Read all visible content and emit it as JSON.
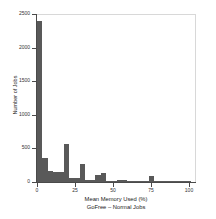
{
  "chart_data": {
    "type": "bar",
    "title": "",
    "xlabel": "Mean Memory Used (%)",
    "sublabel": "GoFree – Normal Jobs",
    "ylabel": "Number of Jobs",
    "xlim": [
      0,
      104
    ],
    "ylim": [
      0,
      2500
    ],
    "grid": false,
    "legend": null,
    "bar_color": "#595959",
    "bin_width": 3.5,
    "xticks": [
      0,
      25,
      50,
      75,
      100
    ],
    "xtick_labels": [
      "0",
      "25",
      "50",
      "75",
      "100"
    ],
    "yticks": [
      0,
      500,
      1000,
      1500,
      2000,
      2500
    ],
    "ytick_labels": [
      "0",
      "500",
      "1000",
      "1500",
      "2000",
      "2500"
    ],
    "bins": [
      {
        "x0": 0.0,
        "x1": 3.5,
        "value": 2400
      },
      {
        "x0": 3.5,
        "x1": 7.0,
        "value": 355
      },
      {
        "x0": 7.0,
        "x1": 10.5,
        "value": 160
      },
      {
        "x0": 10.5,
        "x1": 14.0,
        "value": 150
      },
      {
        "x0": 14.0,
        "x1": 17.5,
        "value": 155
      },
      {
        "x0": 17.5,
        "x1": 21.0,
        "value": 570
      },
      {
        "x0": 21.0,
        "x1": 24.5,
        "value": 60
      },
      {
        "x0": 24.5,
        "x1": 28.0,
        "value": 55
      },
      {
        "x0": 28.0,
        "x1": 31.5,
        "value": 265
      },
      {
        "x0": 31.5,
        "x1": 35.0,
        "value": 30
      },
      {
        "x0": 35.0,
        "x1": 38.5,
        "value": 25
      },
      {
        "x0": 38.5,
        "x1": 42.0,
        "value": 110
      },
      {
        "x0": 42.0,
        "x1": 45.5,
        "value": 130
      },
      {
        "x0": 45.5,
        "x1": 49.0,
        "value": 20
      },
      {
        "x0": 49.0,
        "x1": 52.5,
        "value": 15
      },
      {
        "x0": 52.5,
        "x1": 56.0,
        "value": 35
      },
      {
        "x0": 56.0,
        "x1": 59.5,
        "value": 30
      },
      {
        "x0": 59.5,
        "x1": 63.0,
        "value": 18
      },
      {
        "x0": 63.0,
        "x1": 66.5,
        "value": 12
      },
      {
        "x0": 66.5,
        "x1": 70.0,
        "value": 10
      },
      {
        "x0": 70.0,
        "x1": 73.5,
        "value": 10
      },
      {
        "x0": 73.5,
        "x1": 77.0,
        "value": 95
      },
      {
        "x0": 77.0,
        "x1": 80.5,
        "value": 12
      },
      {
        "x0": 80.5,
        "x1": 84.0,
        "value": 8
      },
      {
        "x0": 84.0,
        "x1": 87.5,
        "value": 8
      },
      {
        "x0": 87.5,
        "x1": 91.0,
        "value": 6
      },
      {
        "x0": 91.0,
        "x1": 94.5,
        "value": 5
      },
      {
        "x0": 94.5,
        "x1": 98.0,
        "value": 5
      },
      {
        "x0": 98.0,
        "x1": 101.5,
        "value": 4
      }
    ]
  }
}
